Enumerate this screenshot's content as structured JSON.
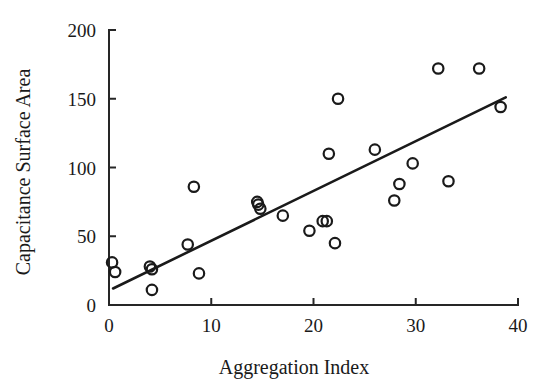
{
  "chart_data": {
    "type": "scatter",
    "title": "",
    "subtitle": "",
    "xlabel": "Aggregation Index",
    "ylabel": "Capacitance Surface Area",
    "xlim": [
      0,
      40
    ],
    "ylim": [
      0,
      200
    ],
    "xticks": [
      0,
      10,
      20,
      30,
      40
    ],
    "yticks": [
      0,
      50,
      100,
      150,
      200
    ],
    "xtick_labels": [
      "0",
      "10",
      "20",
      "30",
      "40"
    ],
    "ytick_labels": [
      "0",
      "50",
      "100",
      "150",
      "200"
    ],
    "grid": false,
    "legend": null,
    "legend_position": "none",
    "marker": "open-circle",
    "marker_color": "#1a1a1a",
    "point_count": 26,
    "points": [
      {
        "x": 0.3,
        "y": 31
      },
      {
        "x": 0.6,
        "y": 24
      },
      {
        "x": 4.0,
        "y": 28
      },
      {
        "x": 4.2,
        "y": 26
      },
      {
        "x": 4.2,
        "y": 11
      },
      {
        "x": 7.7,
        "y": 44
      },
      {
        "x": 8.3,
        "y": 86
      },
      {
        "x": 8.8,
        "y": 23
      },
      {
        "x": 14.5,
        "y": 75
      },
      {
        "x": 14.8,
        "y": 70
      },
      {
        "x": 17.0,
        "y": 65
      },
      {
        "x": 19.6,
        "y": 54
      },
      {
        "x": 20.9,
        "y": 61
      },
      {
        "x": 21.3,
        "y": 61
      },
      {
        "x": 21.5,
        "y": 110
      },
      {
        "x": 22.1,
        "y": 45
      },
      {
        "x": 22.4,
        "y": 150
      },
      {
        "x": 26.0,
        "y": 113
      },
      {
        "x": 27.9,
        "y": 76
      },
      {
        "x": 28.4,
        "y": 88
      },
      {
        "x": 29.7,
        "y": 103
      },
      {
        "x": 32.2,
        "y": 172
      },
      {
        "x": 33.2,
        "y": 90
      },
      {
        "x": 36.2,
        "y": 172
      },
      {
        "x": 38.3,
        "y": 144
      },
      {
        "x": 14.6,
        "y": 73
      }
    ],
    "trendline": {
      "type": "linear-fit",
      "x_start": 0.4,
      "y_start": 12,
      "x_end": 38.8,
      "y_end": 151,
      "slope": 3.62,
      "intercept": 10.55
    }
  },
  "axis": {
    "x_title": "Aggregation Index",
    "y_title": "Capacitance Surface Area"
  }
}
